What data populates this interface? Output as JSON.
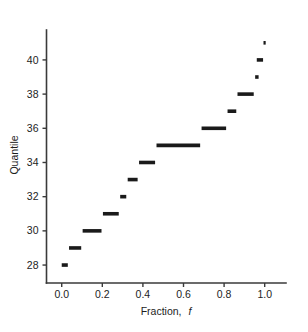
{
  "chart_data": {
    "type": "scatter",
    "title": "",
    "subtitle": "",
    "xlabel": "Fraction, f",
    "xlabel_plain": "Fraction,",
    "xlabel_italic": "f",
    "ylabel": "Quantile",
    "xlim": [
      -0.075,
      1.105
    ],
    "ylim": [
      26.95,
      41.75
    ],
    "xticks": [
      0.0,
      0.2,
      0.4,
      0.6,
      0.8,
      1.0
    ],
    "xticklabels": [
      "0.0",
      "0.2",
      "0.4",
      "0.6",
      "0.8",
      "1.0"
    ],
    "yticks": [
      28,
      30,
      32,
      34,
      36,
      38,
      40
    ],
    "yticklabels": [
      "28",
      "30",
      "32",
      "34",
      "36",
      "38",
      "40"
    ],
    "grid": false,
    "legend": false,
    "legend_position": "none",
    "marker": "horizontal-segment",
    "series_name": "empirical quantile function",
    "segments": [
      {
        "quantile": 28,
        "f_start": 0.0,
        "f_end": 0.03
      },
      {
        "quantile": 29,
        "f_start": 0.036,
        "f_end": 0.096
      },
      {
        "quantile": 30,
        "f_start": 0.103,
        "f_end": 0.196
      },
      {
        "quantile": 31,
        "f_start": 0.203,
        "f_end": 0.281
      },
      {
        "quantile": 32,
        "f_start": 0.288,
        "f_end": 0.318
      },
      {
        "quantile": 33,
        "f_start": 0.325,
        "f_end": 0.374
      },
      {
        "quantile": 34,
        "f_start": 0.381,
        "f_end": 0.46
      },
      {
        "quantile": 35,
        "f_start": 0.467,
        "f_end": 0.682
      },
      {
        "quantile": 36,
        "f_start": 0.689,
        "f_end": 0.81
      },
      {
        "quantile": 37,
        "f_start": 0.817,
        "f_end": 0.86
      },
      {
        "quantile": 38,
        "f_start": 0.866,
        "f_end": 0.946
      },
      {
        "quantile": 39,
        "f_start": 0.953,
        "f_end": 0.97
      },
      {
        "quantile": 40,
        "f_start": 0.961,
        "f_end": 0.992
      },
      {
        "quantile": 41,
        "f_start": 0.996,
        "f_end": 1.003
      }
    ]
  }
}
